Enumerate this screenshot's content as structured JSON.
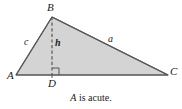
{
  "figure": {
    "type": "geometry-diagram",
    "shape": "triangle",
    "caption_vertex": "A",
    "caption_rest": " is acute.",
    "caption_full": "A is acute.",
    "colors": {
      "fill": "#d4d4d4",
      "stroke": "#555555",
      "text": "#1a1a1a",
      "background": "#ffffff"
    },
    "vertices": [
      {
        "name": "A",
        "label": "A",
        "x": 16,
        "y": 75
      },
      {
        "name": "B",
        "label": "B",
        "x": 52,
        "y": 17
      },
      {
        "name": "C",
        "label": "C",
        "x": 168,
        "y": 75
      }
    ],
    "foot": {
      "name": "D",
      "label": "D",
      "x": 52,
      "y": 75
    },
    "sides": [
      {
        "name": "side-c",
        "label": "c",
        "from": "A",
        "to": "B"
      },
      {
        "name": "side-a",
        "label": "a",
        "from": "B",
        "to": "C"
      }
    ],
    "altitude": {
      "name": "h",
      "label": "h",
      "from": "B",
      "to": "D",
      "style": "dashed"
    },
    "right_angle": {
      "at": "D",
      "marker": "square"
    }
  }
}
